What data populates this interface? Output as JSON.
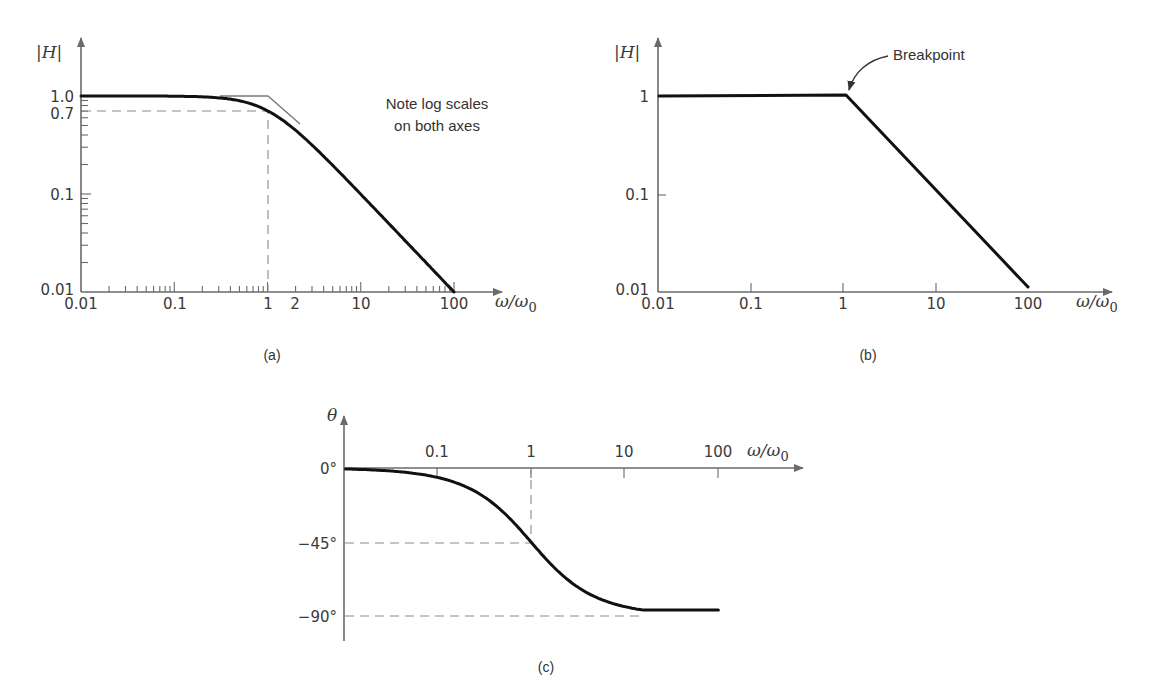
{
  "figure": {
    "panels": [
      {
        "id": "a",
        "label": "(a)"
      },
      {
        "id": "b",
        "label": "(b)"
      },
      {
        "id": "c",
        "label": "(c)"
      }
    ]
  },
  "panel_a": {
    "ylabel": "|H|",
    "xlabel": "ω/ω0",
    "xlabel_main": "ω/ω",
    "xlabel_sub": "0",
    "y_ticks": [
      "1.0",
      "0.7",
      "0.1",
      "0.01"
    ],
    "x_ticks": [
      "0.01",
      "0.1",
      "1",
      "2",
      "10",
      "100"
    ],
    "note_line1": "Note log scales",
    "note_line2": "on both axes",
    "label": "(a)"
  },
  "panel_b": {
    "ylabel": "|H|",
    "xlabel_main": "ω/ω",
    "xlabel_sub": "0",
    "y_ticks": [
      "1",
      "0.1",
      "0.01"
    ],
    "x_ticks": [
      "0.01",
      "0.1",
      "1",
      "10",
      "100"
    ],
    "annotation": "Breakpoint",
    "label": "(b)"
  },
  "panel_c": {
    "ylabel": "θ",
    "xlabel_main": "ω/ω",
    "xlabel_sub": "0",
    "y_ticks": [
      "0°",
      "−45°",
      "−90°"
    ],
    "x_ticks": [
      "0.1",
      "1",
      "10",
      "100"
    ],
    "label": "(c)"
  },
  "chart_data": [
    {
      "type": "line",
      "title": "(a) Low-pass magnitude response, exact curve with asymptotes",
      "xlabel": "ω/ω0",
      "ylabel": "|H|",
      "xscale": "log",
      "yscale": "log",
      "xlim": [
        0.01,
        100
      ],
      "ylim": [
        0.01,
        1.0
      ],
      "x_tick_labels": [
        "0.01",
        "0.1",
        "1",
        "2",
        "10",
        "100"
      ],
      "y_tick_labels": [
        "1.0",
        "0.7",
        "0.1",
        "0.01"
      ],
      "grid": false,
      "series": [
        {
          "name": "|H| = 1/sqrt(1+(ω/ω0)^2)",
          "x": [
            0.01,
            0.1,
            0.3,
            0.5,
            1,
            2,
            3,
            5,
            10,
            30,
            100
          ],
          "y": [
            1.0,
            0.995,
            0.958,
            0.894,
            0.707,
            0.447,
            0.316,
            0.196,
            0.0995,
            0.0333,
            0.01
          ]
        },
        {
          "name": "asymptote",
          "x": [
            0.01,
            1,
            100
          ],
          "y": [
            1.0,
            1.0,
            0.01
          ]
        }
      ],
      "annotations": [
        "Note log scales on both axes",
        "dashed guide at |H|=0.7, ω/ω0=1"
      ]
    },
    {
      "type": "line",
      "title": "(b) Straight-line (Bode) approximation",
      "xlabel": "ω/ω0",
      "ylabel": "|H|",
      "xscale": "log",
      "yscale": "log",
      "xlim": [
        0.01,
        100
      ],
      "ylim": [
        0.01,
        1
      ],
      "x_tick_labels": [
        "0.01",
        "0.1",
        "1",
        "10",
        "100"
      ],
      "y_tick_labels": [
        "1",
        "0.1",
        "0.01"
      ],
      "grid": false,
      "series": [
        {
          "name": "asymptotic |H|",
          "x": [
            0.01,
            1,
            100
          ],
          "y": [
            1,
            1,
            0.01
          ]
        }
      ],
      "annotations": [
        "Breakpoint at ω/ω0 = 1"
      ]
    },
    {
      "type": "line",
      "title": "(c) Phase response",
      "xlabel": "ω/ω0",
      "ylabel": "θ",
      "xscale": "log",
      "xlim": [
        0.01,
        100
      ],
      "ylim": [
        -90,
        0
      ],
      "x_tick_labels": [
        "0.1",
        "1",
        "10",
        "100"
      ],
      "y_tick_labels": [
        "0°",
        "-45°",
        "-90°"
      ],
      "grid": false,
      "series": [
        {
          "name": "θ = -arctan(ω/ω0)",
          "x": [
            0.01,
            0.1,
            0.3,
            1,
            3,
            10,
            30,
            100
          ],
          "y": [
            -0.6,
            -5.7,
            -16.7,
            -45,
            -71.6,
            -84.3,
            -88.1,
            -89.4
          ]
        }
      ],
      "annotations": [
        "dashed guide at θ=-45°, ω/ω0=1",
        "dashed guide at θ=-90°"
      ]
    }
  ]
}
